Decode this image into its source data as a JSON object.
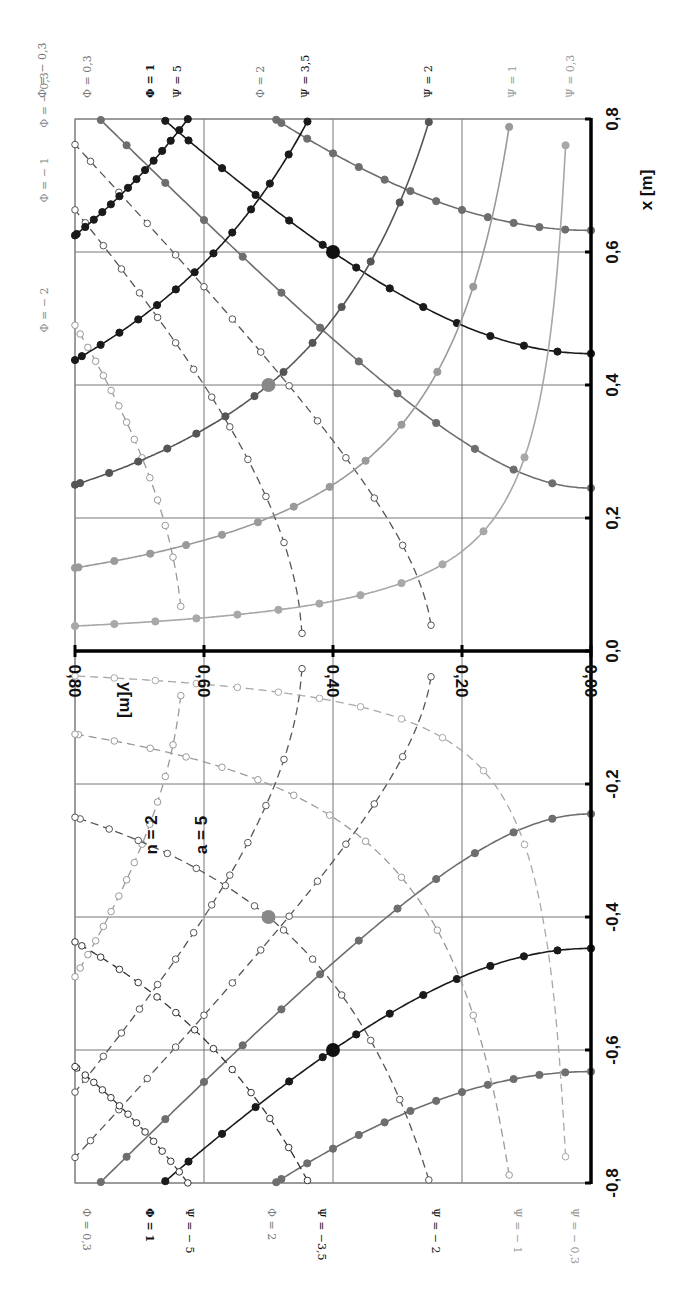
{
  "chart_data": {
    "type": "line",
    "title": "",
    "orientation": "rotated-90",
    "xlabel": "x [m]",
    "ylabel": "y[m]",
    "xlim": [
      -0.8,
      0.8
    ],
    "ylim": [
      0.0,
      0.8
    ],
    "x_ticks": [
      "-0,8",
      "-0,6",
      "-0,4",
      "-0,2",
      "0,0",
      "0,2",
      "0,4",
      "0,6",
      "0,8"
    ],
    "y_ticks": [
      "0,00",
      "0,20",
      "0,40",
      "0,60",
      "0,80"
    ],
    "grid": true,
    "annotations": [
      {
        "text": "n = 2"
      },
      {
        "text": "a = 5"
      }
    ],
    "parameters": {
      "n": 2,
      "a": 5
    },
    "series": [
      {
        "name": "Φ = 0,3",
        "family": "potential",
        "value": 0.3,
        "style": "solid-filled",
        "color": "#6e6e6e"
      },
      {
        "name": "Φ = 1",
        "family": "potential",
        "value": 1,
        "style": "solid-filled",
        "color": "#1a1a1a"
      },
      {
        "name": "Φ = 2",
        "family": "potential",
        "value": 2,
        "style": "solid-filled",
        "color": "#6e6e6e"
      },
      {
        "name": "Φ = − 0,3",
        "family": "potential",
        "value": -0.3,
        "style": "dashed-open",
        "color": "#555555"
      },
      {
        "name": "Φ = − 1",
        "family": "potential",
        "value": -1,
        "style": "dashed-open",
        "color": "#555555"
      },
      {
        "name": "Φ = − 2",
        "family": "potential",
        "value": -2,
        "style": "dashed-open",
        "color": "#999999"
      },
      {
        "name": "Ψ = 5",
        "family": "stream",
        "value": 5,
        "style": "solid-filled",
        "color": "#1a1a1a"
      },
      {
        "name": "Ψ = 3,5",
        "family": "stream",
        "value": 3.5,
        "style": "solid-filled",
        "color": "#1a1a1a"
      },
      {
        "name": "Ψ = 2",
        "family": "stream",
        "value": 2,
        "style": "solid-filled",
        "color": "#555555"
      },
      {
        "name": "Ψ = 1",
        "family": "stream",
        "value": 1,
        "style": "solid-filled",
        "color": "#9a9a9a"
      },
      {
        "name": "Ψ = 0,3",
        "family": "stream",
        "value": 0.3,
        "style": "solid-filled",
        "color": "#a8a8a8"
      },
      {
        "name": "Ψ = − 5",
        "family": "stream",
        "value": -5,
        "style": "dashed-open",
        "color": "#333333"
      },
      {
        "name": "Ψ = −3,5",
        "family": "stream",
        "value": -3.5,
        "style": "dashed-open",
        "color": "#333333"
      },
      {
        "name": "Ψ = − 2",
        "family": "stream",
        "value": -2,
        "style": "dashed-open",
        "color": "#555555"
      },
      {
        "name": "Ψ = − 1",
        "family": "stream",
        "value": -1,
        "style": "dashed-open",
        "color": "#9a9a9a"
      },
      {
        "name": "Ψ = − 0,3",
        "family": "stream",
        "value": -0.3,
        "style": "dashed-open",
        "color": "#a8a8a8"
      }
    ],
    "highlight_points": [
      {
        "x": 0.6,
        "y": 0.4,
        "color": "#111111"
      },
      {
        "x": 0.4,
        "y": 0.5,
        "color": "#888888"
      },
      {
        "x": -0.6,
        "y": 0.4,
        "color": "#111111"
      },
      {
        "x": -0.4,
        "y": 0.5,
        "color": "#888888"
      }
    ]
  },
  "labels": {
    "top": [
      {
        "text": "Φ = − 0,3",
        "x": 42,
        "color": "#777"
      },
      {
        "text": "Φ = 0,3",
        "x": 87,
        "color": "#777"
      },
      {
        "text": "Φ = 1",
        "x": 150,
        "color": "#111",
        "bold": true
      },
      {
        "text": "Ψ = 5",
        "x": 177,
        "color": "#111"
      },
      {
        "text": "Φ = 2",
        "x": 260,
        "color": "#777"
      },
      {
        "text": "Ψ = 3,5",
        "x": 305,
        "color": "#111"
      },
      {
        "text": "Ψ = 2",
        "x": 428,
        "color": "#222"
      },
      {
        "text": "Ψ = 1",
        "x": 512,
        "color": "#999"
      },
      {
        "text": "Ψ = 0,3",
        "x": 570,
        "color": "#999"
      }
    ],
    "bottom": [
      {
        "text": "Φ = 0,3",
        "x": 87,
        "color": "#777"
      },
      {
        "text": "Φ = 1",
        "x": 150,
        "color": "#111",
        "bold": true
      },
      {
        "text": "Ψ = − 5",
        "x": 190,
        "color": "#111"
      },
      {
        "text": "Φ = 2",
        "x": 272,
        "color": "#777"
      },
      {
        "text": "Ψ = −3,5",
        "x": 322,
        "color": "#111"
      },
      {
        "text": "Ψ = − 2",
        "x": 436,
        "color": "#222"
      },
      {
        "text": "Ψ = − 1",
        "x": 518,
        "color": "#999"
      },
      {
        "text": "Ψ = − 0,3",
        "x": 575,
        "color": "#999"
      }
    ],
    "left": [
      {
        "text": "Φ = − 0,3",
        "y": 100,
        "color": "#888"
      },
      {
        "text": "Φ = − 1",
        "y": 180,
        "color": "#888"
      },
      {
        "text": "Φ = − 2",
        "y": 310,
        "color": "#888"
      }
    ]
  }
}
